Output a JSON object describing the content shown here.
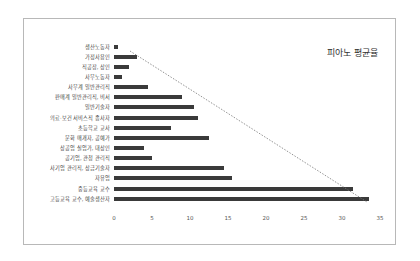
{
  "chart_data": {
    "type": "bar",
    "orientation": "horizontal",
    "title": "피아노 평균율",
    "xlabel": "",
    "ylabel": "",
    "xlim": [
      0,
      35
    ],
    "x_ticks": [
      "0",
      "5",
      "10",
      "15",
      "20",
      "25",
      "30",
      "35"
    ],
    "grid": false,
    "legend": null,
    "categories": [
      "생산노동자",
      "가정사용인",
      "직공장, 상인",
      "사무노동자",
      "사무계 일반관리직",
      "판매계 일반관리직, 비서",
      "일반기술자",
      "의료·보건 서비스직 종사자",
      "초등학교 교사",
      "문화 매개자, 공예가",
      "상공업 실업가, 대상인",
      "공기업, 관청 관리직",
      "사기업 관리직, 상급기술자",
      "자유업",
      "중등교육 교수",
      "고등교육 교수, 예술생산자"
    ],
    "values": [
      0.5,
      3,
      2,
      1,
      4.5,
      9,
      10.5,
      11,
      7.5,
      12.5,
      4,
      5,
      14.5,
      15.5,
      31.5,
      33.5
    ],
    "annotations": [
      "dotted trend line from 가정사용인 (~2) to 고등교육 교수, 예술생산자 (~33.5)"
    ],
    "bar_color": "#3a3a3a"
  }
}
